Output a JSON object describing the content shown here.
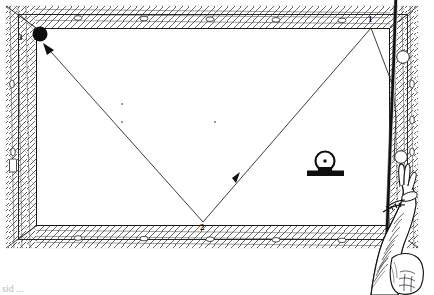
{
  "figure": {
    "caption": "sid ...",
    "style": "black-and-white line drawing"
  },
  "colors": {
    "ink": "#111111",
    "rail_fill": "#ffffff",
    "cloth": "#ffffff",
    "ball_solid": "#0d0d0d",
    "ball_hollow": "#ffffff",
    "pedestal": "#111111",
    "caption_text": "#b9b9b9"
  },
  "table": {
    "name": "pool-table",
    "outer_frame": {
      "x": 6,
      "y": 6,
      "w": 412,
      "h": 242
    },
    "inner_rail": {
      "x": 18,
      "y": 14,
      "w": 390,
      "h": 226
    },
    "playfield": {
      "x": 36,
      "y": 28,
      "w": 354,
      "h": 198
    },
    "rail_texture": "woven-diagonal-hatch",
    "diamond_sights": {
      "top": [
        78,
        144,
        210,
        276,
        342
      ],
      "bottom": [
        78,
        144,
        210,
        276,
        342
      ],
      "left": [
        84,
        152
      ],
      "right": [
        84,
        152
      ],
      "shape": "small-oval"
    },
    "cloth_spots": [
      {
        "x": 122,
        "y": 104
      },
      {
        "x": 122,
        "y": 122
      },
      {
        "x": 215,
        "y": 122
      }
    ]
  },
  "shot_path": {
    "name": "three-rail-bank-path",
    "description": "Cue ball travels from cue at right rail, up to rail point 1, down to rail point 2, then up-left to object ball at point 3",
    "segments": [
      {
        "id": 1,
        "from": {
          "x": 394,
          "y": 160
        },
        "to": {
          "x": 371,
          "y": 28
        },
        "label": "1"
      },
      {
        "id": 2,
        "from": {
          "x": 371,
          "y": 28
        },
        "to": {
          "x": 203,
          "y": 222
        },
        "label": "2",
        "arrow_at": {
          "x": 232,
          "y": 178
        }
      },
      {
        "id": 3,
        "from": {
          "x": 203,
          "y": 222
        },
        "to": {
          "x": 36,
          "y": 40
        },
        "label": "3",
        "arrow_at": {
          "x": 42,
          "y": 46
        }
      }
    ],
    "labels": [
      {
        "text": "1",
        "x": 368,
        "y": 15,
        "anchor": "top-rail-contact"
      },
      {
        "text": "2",
        "x": 200,
        "y": 223,
        "anchor": "bottom-rail-contact"
      },
      {
        "text": "3",
        "x": 18,
        "y": 33,
        "anchor": "target-ball"
      }
    ]
  },
  "balls": [
    {
      "name": "object-ball",
      "type": "solid",
      "x": 40,
      "y": 34,
      "r": 7.5,
      "fill": "#0d0d0d"
    },
    {
      "name": "cue-ball-upper",
      "type": "hollow",
      "x": 403,
      "y": 57,
      "r": 6.5,
      "fill": "#ffffff"
    },
    {
      "name": "cue-ball-lower",
      "type": "hollow",
      "x": 401,
      "y": 157,
      "r": 6.5,
      "fill": "#ffffff"
    }
  ],
  "aim_icon": {
    "name": "cue-ball-center-hit-icon",
    "description": "circle with center dot on a base, indicating center-ball contact point",
    "circle": {
      "x": 325,
      "y": 161,
      "r": 10
    },
    "center_dot": {
      "x": 325,
      "y": 161,
      "r": 1.8
    },
    "base": {
      "x": 307,
      "y": 171,
      "w": 37,
      "h": 6
    }
  },
  "hand": {
    "name": "hand-holding-cue",
    "description": "shaded line-art hand and forearm gripping a vertical cue stick at the right rail",
    "cue_stick": {
      "x1": 395,
      "y1": 0,
      "x2": 386,
      "y2": 295,
      "width": 3.5
    }
  }
}
